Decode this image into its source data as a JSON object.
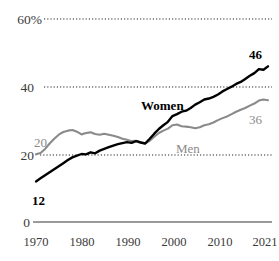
{
  "chart_data": {
    "type": "line",
    "title": "",
    "subtitle": "",
    "xlabel": "",
    "ylabel": "",
    "xlim": [
      1970,
      2021
    ],
    "ylim": [
      0,
      60
    ],
    "grid": "horizontal-dotted",
    "gridlines": [
      20,
      40,
      60
    ],
    "y_ticks": [
      "0",
      "20",
      "40",
      "60%"
    ],
    "y_tick_values": [
      0,
      20,
      40,
      60
    ],
    "x_ticks": [
      "1970",
      "1980",
      "1990",
      "2000",
      "2010",
      "2021"
    ],
    "x_tick_values": [
      1970,
      1980,
      1990,
      2000,
      2010,
      2021
    ],
    "legend_position": "inline-annotations",
    "series": [
      {
        "name": "Women",
        "color": "#000000",
        "label_start": "12",
        "label_end": "46",
        "x": [
          1970,
          1971,
          1972,
          1973,
          1974,
          1975,
          1976,
          1977,
          1978,
          1979,
          1980,
          1981,
          1982,
          1983,
          1984,
          1985,
          1986,
          1987,
          1988,
          1989,
          1990,
          1991,
          1992,
          1993,
          1994,
          1995,
          1996,
          1997,
          1998,
          1999,
          2000,
          2001,
          2002,
          2003,
          2004,
          2005,
          2006,
          2007,
          2008,
          2009,
          2010,
          2011,
          2012,
          2013,
          2014,
          2015,
          2016,
          2017,
          2018,
          2019,
          2020,
          2021
        ],
        "values": [
          12.0,
          12.9,
          13.8,
          14.7,
          15.6,
          16.5,
          17.4,
          18.3,
          19.1,
          19.6,
          20.1,
          20.0,
          20.6,
          20.3,
          21.1,
          21.6,
          22.1,
          22.6,
          23.0,
          23.3,
          23.6,
          23.4,
          23.9,
          23.5,
          23.2,
          24.6,
          26.1,
          27.5,
          28.6,
          29.6,
          31.3,
          31.9,
          32.6,
          32.9,
          33.7,
          34.7,
          35.4,
          36.2,
          36.5,
          37.0,
          37.7,
          38.6,
          39.3,
          40.0,
          40.8,
          41.4,
          42.3,
          43.2,
          44.0,
          45.2,
          45.0,
          46.0
        ]
      },
      {
        "name": "Men",
        "color": "#8a8a8a",
        "label_start": "20",
        "label_end": "36",
        "x": [
          1970,
          1971,
          1972,
          1973,
          1974,
          1975,
          1976,
          1977,
          1978,
          1979,
          1980,
          1981,
          1982,
          1983,
          1984,
          1985,
          1986,
          1987,
          1988,
          1989,
          1990,
          1991,
          1992,
          1993,
          1994,
          1995,
          1996,
          1997,
          1998,
          1999,
          2000,
          2001,
          2002,
          2003,
          2004,
          2005,
          2006,
          2007,
          2008,
          2009,
          2010,
          2011,
          2012,
          2013,
          2014,
          2015,
          2016,
          2017,
          2018,
          2019,
          2020,
          2021
        ],
        "values": [
          20.0,
          20.4,
          21.6,
          23.2,
          24.6,
          25.8,
          26.6,
          27.0,
          27.2,
          26.7,
          25.9,
          26.3,
          26.5,
          26.0,
          25.8,
          26.1,
          25.8,
          25.5,
          25.1,
          24.6,
          24.3,
          23.9,
          24.0,
          23.6,
          23.2,
          24.0,
          25.2,
          26.3,
          27.0,
          27.6,
          28.6,
          28.8,
          28.3,
          28.2,
          28.0,
          27.7,
          28.0,
          28.6,
          28.9,
          29.4,
          30.1,
          30.7,
          31.2,
          31.9,
          32.6,
          33.2,
          33.7,
          34.4,
          35.0,
          35.9,
          36.2,
          36.0
        ]
      }
    ],
    "annotations": [
      {
        "text": "Women",
        "series": "Women",
        "style": "bold-black"
      },
      {
        "text": "Men",
        "series": "Men",
        "style": "gray"
      },
      {
        "text": "12",
        "series": "Women",
        "style": "bold-black",
        "role": "start-value"
      },
      {
        "text": "46",
        "series": "Women",
        "style": "bold-black",
        "role": "end-value"
      },
      {
        "text": "20",
        "series": "Men",
        "style": "gray",
        "role": "start-value"
      },
      {
        "text": "36",
        "series": "Men",
        "style": "gray",
        "role": "end-value"
      }
    ]
  },
  "axis": {
    "y": {
      "t60": "60%",
      "t40": "40",
      "t20": "20",
      "t0": "0"
    },
    "x": {
      "t1970": "1970",
      "t1980": "1980",
      "t1990": "1990",
      "t2000": "2000",
      "t2010": "2010",
      "t2021": "2021"
    }
  },
  "labels": {
    "women": "Women",
    "men": "Men",
    "women_start": "12",
    "women_end": "46",
    "men_start": "20",
    "men_end": "36"
  },
  "colors": {
    "women_line": "#000000",
    "men_line": "#8a8a8a",
    "gridline": "#2b2b2b",
    "axis_line": "#9a9a9a",
    "tick_text": "#3a3a3a"
  }
}
